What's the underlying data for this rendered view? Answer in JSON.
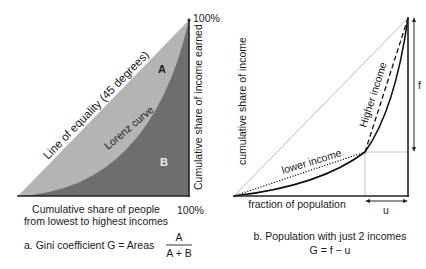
{
  "panel_a": {
    "line_of_equality_label": "Line of equality (45 degrees)",
    "lorenz_curve_label": "Lorenz curve",
    "area_a_label": "A",
    "area_b_label": "B",
    "y_axis_label": "Cumulative share of income earned",
    "top_percent": "100%",
    "right_percent": "100%",
    "x_axis_label_line1": "Cumulative share of people",
    "x_axis_label_line2": "from lowest to highest incomes",
    "caption": "a. Gini coefficient G = Areas",
    "fraction_numerator": "A",
    "fraction_denominator": "A + B",
    "colors": {
      "area_a": "#b4b4b4",
      "area_b": "#6e6e6e",
      "axis": "#222222"
    }
  },
  "panel_b": {
    "y_axis_label": "cumulative share of income",
    "higher_income_label": "Higher income",
    "lower_income_label": "lower income",
    "x_axis_label": "fraction of population",
    "f_label": "f",
    "u_label": "u",
    "caption_line1": "b. Population with just 2 incomes",
    "caption_line2": "G = f − u",
    "colors": {
      "equality_line": "#bdbdbd",
      "curve": "#111111",
      "guide": "#c8c8c8"
    }
  }
}
